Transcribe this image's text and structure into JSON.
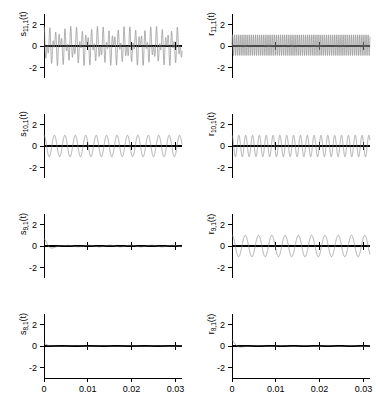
{
  "figure": {
    "rows": 4,
    "cols": 2,
    "width": 376,
    "height": 400,
    "trace_color": "#8a8a8a",
    "axis_color": "#000000",
    "background": "#ffffff"
  },
  "axes": {
    "xlim": [
      0,
      0.0315
    ],
    "ylim": [
      -3,
      3
    ],
    "xticks": [
      0,
      0.01,
      0.02,
      0.03
    ],
    "xtick_labels": [
      "0",
      "0.01",
      "0.02",
      "0.03"
    ],
    "yticks": [
      2,
      0,
      -2
    ],
    "ytick_labels": [
      "2",
      "0",
      "-2"
    ],
    "xlabel": "",
    "ylabel": "",
    "grid": false,
    "xtick_labels_on_bottom_row_only": true
  },
  "chart_data": {
    "type": "line",
    "title": "",
    "xlabel": "",
    "ylabel": "",
    "xlim": [
      0,
      0.0315
    ],
    "ylim": [
      -3,
      3
    ],
    "xticks": [
      0,
      0.01,
      0.02,
      0.03
    ],
    "yticks": [
      2,
      0,
      -2
    ],
    "legend": "none",
    "panels": [
      {
        "name": "s-11-1",
        "row": 0,
        "col": 0,
        "label_base": "s",
        "label_sub": "11,1",
        "label": "s_{11,1}(t)",
        "description": "Amplitude-modulated beating oscillation, peak amplitude about 2",
        "carrier_hz": 1150,
        "modulation_hz": 330,
        "amplitude": 1.85,
        "decay_per_second": 0,
        "phase": 1.4,
        "waveform": "beat"
      },
      {
        "name": "r-11-1",
        "row": 0,
        "col": 1,
        "label_base": "r",
        "label_sub": "11,1",
        "label": "r_{11,1}(t)",
        "description": "Dense high-frequency oscillation, positive-skewed peaks, amplitude about 1.1",
        "carrier_hz": 2100,
        "modulation_hz": 0,
        "amplitude": 1.05,
        "decay_per_second": 0,
        "phase": 0,
        "waveform": "skewed"
      },
      {
        "name": "s-10-1",
        "row": 1,
        "col": 0,
        "label_base": "s",
        "label_sub": "10,1",
        "label": "s_{10,1}(t)",
        "description": "Smooth sinusoid of amplitude about 1",
        "carrier_hz": 420,
        "modulation_hz": 0,
        "amplitude": 1.0,
        "decay_per_second": 0,
        "phase": 1.5708,
        "waveform": "sine"
      },
      {
        "name": "r-10-1",
        "row": 1,
        "col": 1,
        "label_base": "r",
        "label_sub": "10,1",
        "label": "r_{10,1}(t)",
        "description": "Sinusoid about twice the frequency of s_{10,1}, amplitude about 1",
        "carrier_hz": 640,
        "modulation_hz": 0,
        "amplitude": 1.0,
        "decay_per_second": 0,
        "phase": 1.5708,
        "waveform": "sine"
      },
      {
        "name": "s-9-1",
        "row": 2,
        "col": 0,
        "label_base": "s",
        "label_sub": "9,1",
        "label": "s_{9,1}(t)",
        "description": "Rapidly decaying transient pulse near t=0, then near zero with tiny ripple",
        "carrier_hz": 260,
        "modulation_hz": 0,
        "amplitude": 0.72,
        "decay_per_second": 700,
        "phase": 1.5708,
        "waveform": "decay",
        "residual_amplitude": 0.07,
        "residual_hz": 210
      },
      {
        "name": "r-9-1",
        "row": 2,
        "col": 1,
        "label_base": "r",
        "label_sub": "9,1",
        "label": "r_{9,1}(t)",
        "description": "Sustained oscillation of amplitude about 1 with slight growth then steady",
        "carrier_hz": 330,
        "modulation_hz": 0,
        "amplitude": 1.0,
        "decay_per_second": 0,
        "phase": 1.5708,
        "waveform": "sine"
      },
      {
        "name": "s-8-1",
        "row": 3,
        "col": 0,
        "label_base": "s",
        "label_sub": "8,1",
        "label": "s_{8,1}(t)",
        "description": "Very small decaying blip at t=0, essentially flat at zero afterwards",
        "carrier_hz": 150,
        "modulation_hz": 0,
        "amplitude": 0.3,
        "decay_per_second": 1500,
        "phase": 1.5708,
        "waveform": "decay",
        "residual_amplitude": 0.02,
        "residual_hz": 160
      },
      {
        "name": "r-8-1",
        "row": 3,
        "col": 1,
        "label_base": "r",
        "label_sub": "8,1",
        "label": "r_{8,1}(t)",
        "description": "Short decaying oscillatory transient near t=0, then near zero ripple",
        "carrier_hz": 230,
        "modulation_hz": 0,
        "amplitude": 0.62,
        "decay_per_second": 900,
        "phase": 1.5708,
        "waveform": "decay",
        "residual_amplitude": 0.05,
        "residual_hz": 190
      }
    ]
  }
}
